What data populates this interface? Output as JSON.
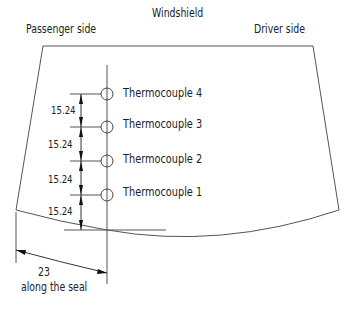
{
  "diagram": {
    "title": "Windshield",
    "left_label": "Passenger side",
    "right_label": "Driver side",
    "thermocouples": [
      {
        "label": "Thermocouple 4"
      },
      {
        "label": "Thermocouple 3"
      },
      {
        "label": "Thermocouple 2"
      },
      {
        "label": "Thermocouple 1"
      }
    ],
    "spacing_dims": [
      "15.24",
      "15.24",
      "15.24",
      "15.24"
    ],
    "seal_dim": {
      "value": "23",
      "note": "along the seal"
    },
    "colors": {
      "line": "#555555",
      "text": "#222222"
    }
  }
}
